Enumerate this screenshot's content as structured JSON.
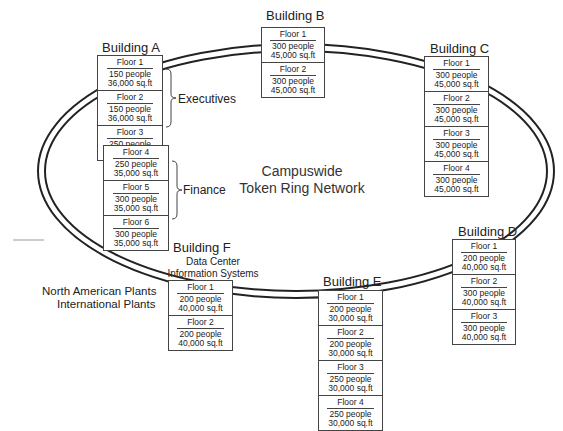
{
  "center": {
    "line1": "Campuswide",
    "line2": "Token Ring Network"
  },
  "groups": {
    "executives": "Executives",
    "finance": "Finance"
  },
  "external": {
    "north_american": "North American Plants",
    "international": "International Plants"
  },
  "buildings": {
    "a": {
      "title": "Building A",
      "floors": [
        {
          "name": "Floor 1",
          "people": "150 people",
          "area": "36,000 sq.ft"
        },
        {
          "name": "Floor 2",
          "people": "150 people",
          "area": "36,000 sq.ft"
        },
        {
          "name": "Floor 3",
          "people": "250 people",
          "area": "35,000 sq.ft"
        },
        {
          "name": "Floor 4",
          "people": "250 people",
          "area": "35,000 sq.ft"
        },
        {
          "name": "Floor 5",
          "people": "300 people",
          "area": "35,000 sq.ft"
        },
        {
          "name": "Floor 6",
          "people": "300 people",
          "area": "35,000 sq.ft"
        }
      ]
    },
    "b": {
      "title": "Building B",
      "floors": [
        {
          "name": "Floor 1",
          "people": "300 people",
          "area": "45,000 sq.ft"
        },
        {
          "name": "Floor 2",
          "people": "300 people",
          "area": "45,000 sq.ft"
        }
      ]
    },
    "c": {
      "title": "Building C",
      "floors": [
        {
          "name": "Floor 1",
          "people": "300 people",
          "area": "45,000 sq.ft"
        },
        {
          "name": "Floor 2",
          "people": "300 people",
          "area": "45,000 sq.ft"
        },
        {
          "name": "Floor 3",
          "people": "300 people",
          "area": "45,000 sq.ft"
        },
        {
          "name": "Floor 4",
          "people": "300 people",
          "area": "45,000 sq.ft"
        }
      ]
    },
    "d": {
      "title": "Building D",
      "floors": [
        {
          "name": "Floor 1",
          "people": "200 people",
          "area": "40,000 sq.ft"
        },
        {
          "name": "Floor 2",
          "people": "300 people",
          "area": "40,000 sq.ft"
        },
        {
          "name": "Floor 3",
          "people": "300 people",
          "area": "40,000 sq.ft"
        }
      ]
    },
    "e": {
      "title": "Building E",
      "floors": [
        {
          "name": "Floor 1",
          "people": "200 people",
          "area": "30,000 sq.ft"
        },
        {
          "name": "Floor 2",
          "people": "200 people",
          "area": "30,000 sq.ft"
        },
        {
          "name": "Floor 3",
          "people": "250 people",
          "area": "30,000 sq.ft"
        },
        {
          "name": "Floor 4",
          "people": "250 people",
          "area": "30,000 sq.ft"
        }
      ]
    },
    "f": {
      "title": "Building F",
      "subtitle1": "Data Center",
      "subtitle2": "Information Systems",
      "floors": [
        {
          "name": "Floor 1",
          "people": "200 people",
          "area": "40,000 sq.ft"
        },
        {
          "name": "Floor 2",
          "people": "200 people",
          "area": "40,000 sq.ft"
        }
      ]
    }
  }
}
